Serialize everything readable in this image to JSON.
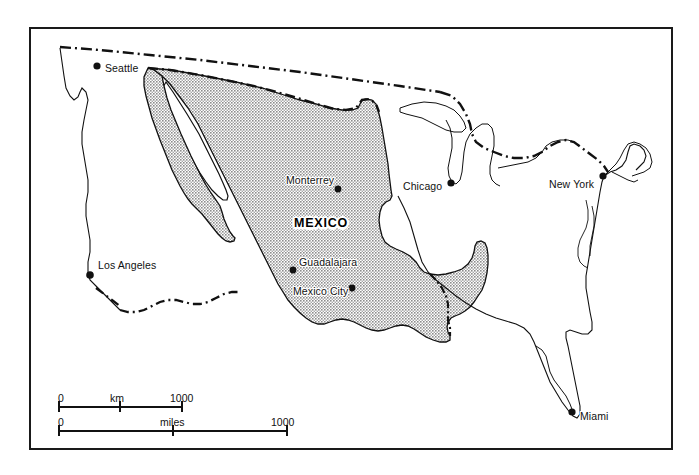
{
  "map": {
    "title_label": "MEXICO",
    "frame": {
      "border_color": "#1a1a1a"
    },
    "fill_color": "#b9b9b9",
    "outline_color": "#111111",
    "cities": [
      {
        "name": "Seattle",
        "x": 97,
        "y": 66,
        "label_dx": 8,
        "label_dy": -4
      },
      {
        "name": "Los Angeles",
        "x": 90,
        "y": 275,
        "label_dx": 8,
        "label_dy": -16
      },
      {
        "name": "Monterrey",
        "x": 338,
        "y": 189,
        "label_dx": -52,
        "label_dy": -15
      },
      {
        "name": "Guadalajara",
        "x": 293,
        "y": 270,
        "label_dx": 6,
        "label_dy": -14
      },
      {
        "name": "Mexico City",
        "x": 352,
        "y": 288,
        "label_dx": -59,
        "label_dy": -3
      },
      {
        "name": "Chicago",
        "x": 451,
        "y": 183,
        "label_dx": -48,
        "label_dy": -3
      },
      {
        "name": "New York",
        "x": 603,
        "y": 176,
        "label_dx": -54,
        "label_dy": 2
      },
      {
        "name": "Miami",
        "x": 572,
        "y": 412,
        "label_dx": 8,
        "label_dy": -2
      }
    ],
    "scale": {
      "km": {
        "unit": "km",
        "start_label": "0",
        "end_label": "1000",
        "length_px": 125
      },
      "miles": {
        "unit": "miles",
        "start_label": "0",
        "end_label": "1000",
        "length_px": 230
      }
    }
  }
}
